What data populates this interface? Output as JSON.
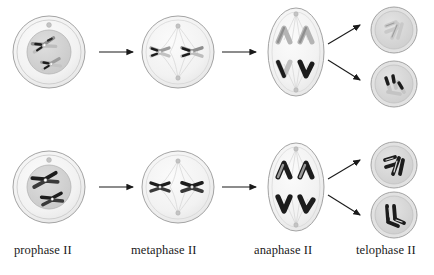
{
  "diagram": {
    "background_color": "#ffffff",
    "labels": [
      {
        "id": "prophase",
        "text": "prophase II"
      },
      {
        "id": "metaphase",
        "text": "metaphase II"
      },
      {
        "id": "anaphase",
        "text": "anaphase II"
      },
      {
        "id": "telophase",
        "text": "telophase II"
      }
    ],
    "colors": {
      "cell_outline": "#8a8a8a",
      "cell_fill": "#f4f4f4",
      "nucleus_fill": "#d4d4d4",
      "nucleus_outline": "#b0b0b0",
      "chromosome_light": "#c8c8c8",
      "chromosome_dark": "#1c1c1c",
      "chromosome_outline": "#7a7a7a",
      "spindle": "#c9c9c9",
      "arrow": "#1a1a1a",
      "centrosome": "#bdbdbd",
      "text": "#1a1a1a"
    },
    "rows": [
      {
        "id": "row-top",
        "cells": [
          {
            "stage": "prophase II",
            "shape": "circle",
            "chromosome_tone": "light",
            "chromosome_count": 2
          },
          {
            "stage": "metaphase II",
            "shape": "circle",
            "chromosome_tone": "light",
            "chromosome_count": 2
          },
          {
            "stage": "anaphase II",
            "shape": "oval",
            "chromatid_groups": 4,
            "pole_tones": [
              "light",
              "dark"
            ]
          },
          {
            "stage": "telophase II",
            "shape": "circle",
            "chromatid_tone": "light",
            "chromatid_count": 4
          },
          {
            "stage": "telophase II",
            "shape": "circle",
            "chromatid_tone": "dark",
            "chromatid_count": 4
          }
        ]
      },
      {
        "id": "row-bottom",
        "cells": [
          {
            "stage": "prophase II",
            "shape": "circle",
            "chromosome_tone": "dark",
            "chromosome_count": 2
          },
          {
            "stage": "metaphase II",
            "shape": "circle",
            "chromosome_tone": "dark",
            "chromosome_count": 2
          },
          {
            "stage": "anaphase II",
            "shape": "oval",
            "chromatid_groups": 4,
            "pole_tones": [
              "light",
              "dark"
            ]
          },
          {
            "stage": "telophase II",
            "shape": "circle",
            "chromatid_tone": "dark",
            "chromatid_count": 4
          },
          {
            "stage": "telophase II",
            "shape": "circle",
            "chromatid_tone": "dark",
            "chromatid_count": 4
          }
        ]
      }
    ],
    "arrows": [
      {
        "id": "top-prophase-to-metaphase",
        "type": "straight"
      },
      {
        "id": "top-metaphase-to-anaphase",
        "type": "straight"
      },
      {
        "id": "top-anaphase-to-telophase-upper",
        "type": "diagonal-up"
      },
      {
        "id": "top-anaphase-to-telophase-lower",
        "type": "diagonal-down"
      },
      {
        "id": "bottom-prophase-to-metaphase",
        "type": "straight"
      },
      {
        "id": "bottom-metaphase-to-anaphase",
        "type": "straight"
      },
      {
        "id": "bottom-anaphase-to-telophase-upper",
        "type": "diagonal-up"
      },
      {
        "id": "bottom-anaphase-to-telophase-lower",
        "type": "diagonal-down"
      }
    ]
  }
}
